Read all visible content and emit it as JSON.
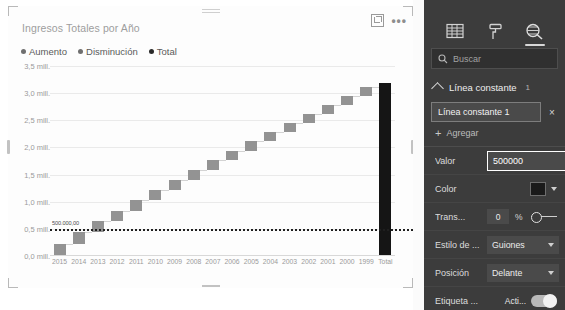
{
  "visual": {
    "title": "Ingresos Totales por Año",
    "focus_icon": "focus-mode-icon",
    "more_icon": "more-options-icon",
    "legend": [
      {
        "label": "Aumento",
        "color": "#939393"
      },
      {
        "label": "Disminución",
        "color": "#6f6f6f"
      },
      {
        "label": "Total",
        "color": "#151515"
      }
    ]
  },
  "chart_data": {
    "type": "bar",
    "chart_subtype": "waterfall",
    "title": "Ingresos Totales por Año",
    "xlabel": "",
    "ylabel": "",
    "ylim": [
      0,
      3500000
    ],
    "ytick_labels": [
      "0,0 mill.",
      "0,5 mill.",
      "1,0 mill.",
      "1,5 mill.",
      "2,0 mill.",
      "2,5 mill.",
      "3,0 mill.",
      "3,5 mill."
    ],
    "ytick_values": [
      0,
      500000,
      1000000,
      1500000,
      2000000,
      2500000,
      3000000,
      3500000
    ],
    "grid": true,
    "legend_position": "top",
    "categories": [
      "2015",
      "2014",
      "2013",
      "2012",
      "2011",
      "2010",
      "2009",
      "2008",
      "2007",
      "2006",
      "2005",
      "2004",
      "2003",
      "2002",
      "2001",
      "2000",
      "1999",
      "Total"
    ],
    "values": [
      230000,
      210000,
      200000,
      195000,
      190000,
      188000,
      185000,
      182000,
      180000,
      178000,
      175000,
      172000,
      170000,
      168000,
      165000,
      162000,
      160000,
      3195000
    ],
    "cumulative": [
      230000,
      440000,
      640000,
      835000,
      1025000,
      1213000,
      1398000,
      1580000,
      1760000,
      1938000,
      2113000,
      2285000,
      2455000,
      2623000,
      2788000,
      2950000,
      3110000,
      3195000
    ],
    "kinds": [
      "increase",
      "increase",
      "increase",
      "increase",
      "increase",
      "increase",
      "increase",
      "increase",
      "increase",
      "increase",
      "increase",
      "increase",
      "increase",
      "increase",
      "increase",
      "increase",
      "increase",
      "total"
    ],
    "constant_line": {
      "value": 500000,
      "label": "500.000,00",
      "style": "dotted",
      "color": "#1f1f1f"
    }
  },
  "pane": {
    "tabs": [
      {
        "name": "fields-tab",
        "icon": "fields-grid-icon",
        "selected": false
      },
      {
        "name": "format-tab",
        "icon": "paint-roller-icon",
        "selected": false
      },
      {
        "name": "analytics-tab",
        "icon": "magnifier-analytics-icon",
        "selected": true
      }
    ],
    "search": {
      "placeholder": "Buscar",
      "value": "",
      "icon": "search-icon"
    },
    "section": {
      "title": "Línea constante",
      "count": "1",
      "chevron": "chevron-up-icon",
      "item_name": "Línea constante 1",
      "remove_label": "×",
      "add_label": "Agregar",
      "add_icon": "plus-icon"
    },
    "properties": [
      {
        "label": "Valor",
        "control": "text",
        "value": "500000"
      },
      {
        "label": "Color",
        "control": "color",
        "value": "#1a1a1a"
      },
      {
        "label": "Trans...",
        "control": "number-slider",
        "value": "0",
        "unit": "%"
      },
      {
        "label": "Estilo de ...",
        "control": "dropdown",
        "value": "Guiones"
      },
      {
        "label": "Posición",
        "control": "dropdown",
        "value": "Delante"
      },
      {
        "label": "Etiqueta ...",
        "control": "toggle",
        "value": "Acti...",
        "state": "on"
      }
    ]
  }
}
